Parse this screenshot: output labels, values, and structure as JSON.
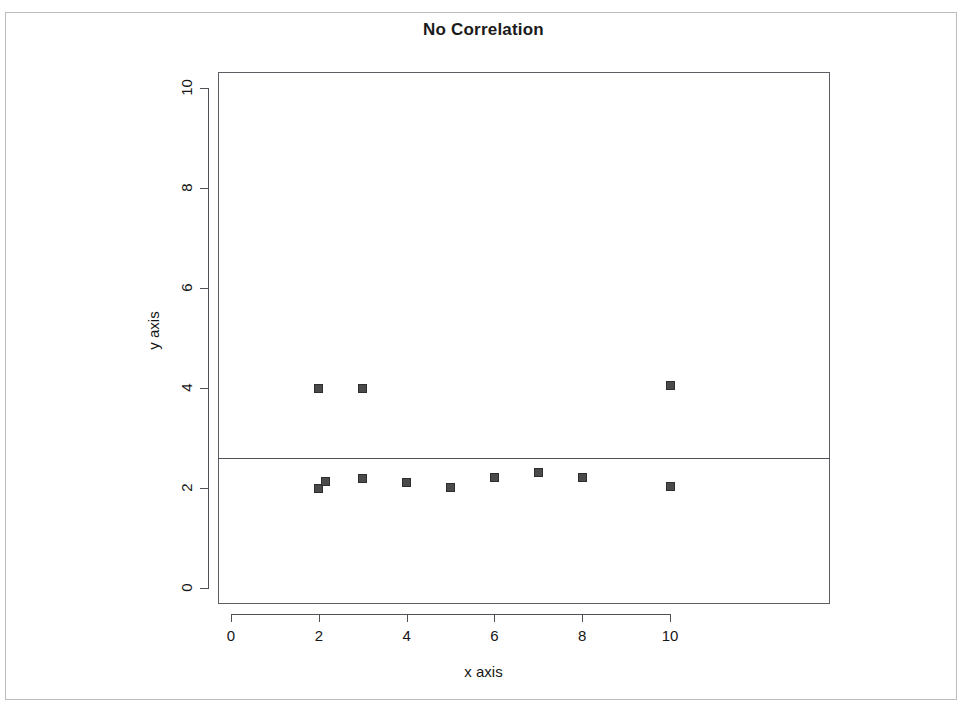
{
  "figure": {
    "title": "No Correlation",
    "x_axis_label": "x axis",
    "y_axis_label": "y axis"
  },
  "chart_data": {
    "type": "scatter",
    "title": "No Correlation",
    "xlabel": "x axis",
    "ylabel": "y axis",
    "xlim": [
      -0.3,
      11.0
    ],
    "ylim": [
      -0.35,
      10.6
    ],
    "grid": false,
    "legend": null,
    "x_ticks": [
      0,
      2,
      4,
      6,
      8,
      10
    ],
    "y_ticks": [
      0,
      2,
      4,
      6,
      8,
      10
    ],
    "x_tick_labels": [
      "0",
      "2",
      "4",
      "6",
      "8",
      "10"
    ],
    "y_tick_labels": [
      "0",
      "2",
      "4",
      "6",
      "8",
      "10"
    ],
    "marker": "filled-square",
    "marker_color": "#4a4a4a",
    "points": [
      {
        "x": 2,
        "y": 4.0
      },
      {
        "x": 3,
        "y": 4.0
      },
      {
        "x": 10,
        "y": 4.05
      },
      {
        "x": 2,
        "y": 2.0
      },
      {
        "x": 2.15,
        "y": 2.13
      },
      {
        "x": 3,
        "y": 2.2
      },
      {
        "x": 4,
        "y": 2.12
      },
      {
        "x": 5,
        "y": 2.02
      },
      {
        "x": 6,
        "y": 2.22
      },
      {
        "x": 7,
        "y": 2.32
      },
      {
        "x": 8,
        "y": 2.22
      },
      {
        "x": 10,
        "y": 2.04
      }
    ],
    "annotations": [
      {
        "type": "horizontal-line",
        "name": "regression-line",
        "y": 2.6,
        "color": "#4d5155"
      }
    ]
  }
}
